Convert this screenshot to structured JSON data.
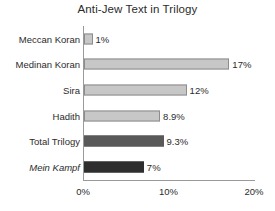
{
  "chart_data": {
    "type": "bar",
    "orientation": "horizontal",
    "title": "Anti-Jew Text in Trilogy",
    "xlabel": "",
    "ylabel": "",
    "xlim": [
      0,
      20
    ],
    "grid": false,
    "legend": null,
    "xticks": [
      "0%",
      "10%",
      "20%"
    ],
    "xtick_values": [
      0,
      10,
      20
    ],
    "categories": [
      "Meccan Koran",
      "Medinan Koran",
      "Sira",
      "Hadith",
      "Total Trilogy",
      "Mein Kampf"
    ],
    "values": [
      1,
      17,
      12,
      8.9,
      9.3,
      7
    ],
    "data_labels": [
      "1%",
      "17%",
      "12%",
      "8.9%",
      "9.3%",
      "7%"
    ],
    "bar_colors": [
      "#c7c7c7",
      "#c7c7c7",
      "#c7c7c7",
      "#c7c7c7",
      "#595959",
      "#2e2e2e"
    ],
    "italic_categories": [
      "Mein Kampf"
    ]
  },
  "style": {
    "axis_color": "#9a9a9a",
    "text_color": "#2b2b2b",
    "bar_border": "#8c8c8c",
    "background": "#ffffff"
  }
}
